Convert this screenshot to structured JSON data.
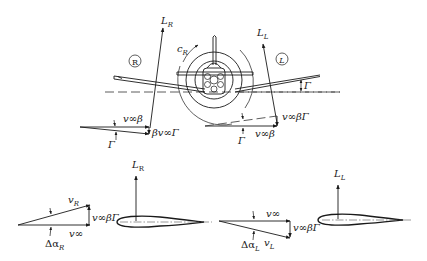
{
  "diagram": {
    "title": "",
    "colors": {
      "ink": "#1a1a1a",
      "background": "#ffffff"
    },
    "front_view": {
      "right_wing_marker": "R",
      "left_wing_marker": "L",
      "lift_right": {
        "symbol": "L",
        "sub": "R"
      },
      "lift_left": {
        "symbol": "L",
        "sub": "L"
      },
      "roll_moment": {
        "symbol": "c",
        "sub": "R"
      },
      "dihedral_angle": "Γ",
      "right_triangle": {
        "top_label": "v∞β",
        "side_label": "βv∞Γ",
        "angle_label": "Γ"
      },
      "left_triangle": {
        "side_label": "v∞βΓ",
        "bottom_label": "v∞β",
        "angle_label": "Γ"
      }
    },
    "airfoil_right": {
      "lift": {
        "symbol": "L",
        "sub": "R"
      },
      "resultant_velocity": {
        "symbol": "v",
        "sub": "R"
      },
      "freestream": "v∞",
      "vertical_component": "v∞βΓ",
      "angle_change": {
        "symbol": "Δα",
        "sub": "R"
      }
    },
    "airfoil_left": {
      "lift": {
        "symbol": "L",
        "sub": "L"
      },
      "resultant_velocity": {
        "symbol": "v",
        "sub": "L"
      },
      "freestream": "v∞",
      "vertical_component": "v∞βΓ",
      "angle_change": {
        "symbol": "Δα",
        "sub": "L"
      }
    }
  }
}
